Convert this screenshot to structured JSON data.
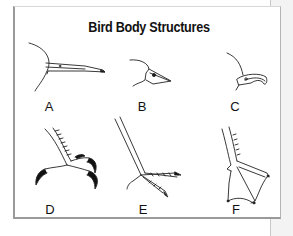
{
  "title": "Bird Body Structures",
  "figures": [
    {
      "label": "A",
      "part": "beak",
      "description": "long thin probing beak"
    },
    {
      "label": "B",
      "part": "beak",
      "description": "short conical seed-cracking beak"
    },
    {
      "label": "C",
      "part": "beak",
      "description": "hooked tearing beak"
    },
    {
      "label": "D",
      "part": "foot",
      "description": "grasping talons"
    },
    {
      "label": "E",
      "part": "foot",
      "description": "long-toed wading foot"
    },
    {
      "label": "F",
      "part": "foot",
      "description": "webbed swimming foot"
    }
  ],
  "colors": {
    "ink": "#111111",
    "frame": "#9a9a9a",
    "background": "#ffffff"
  }
}
